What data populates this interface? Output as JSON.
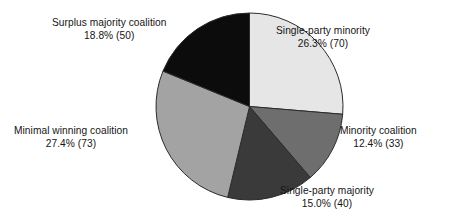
{
  "chart_data": {
    "type": "pie",
    "title": "",
    "subtitle": "",
    "xlabel": "",
    "ylabel": "",
    "legend_position": "none",
    "grid": false,
    "start_angle_deg": 0,
    "direction": "clockwise",
    "total_count": 266,
    "categories": [
      "Single-party minority",
      "Minority coalition",
      "Single-party majority",
      "Minimal winning coalition",
      "Surplus majority coalition"
    ],
    "values": [
      26.3,
      12.4,
      15.0,
      27.4,
      18.8
    ],
    "counts": [
      70,
      33,
      40,
      73,
      50
    ],
    "colors": [
      "#e6e6e6",
      "#6e6e6e",
      "#3a3a3a",
      "#a3a3a3",
      "#0c0c0c"
    ],
    "slices": [
      {
        "name": "Single-party minority",
        "percent": 26.3,
        "count": 70,
        "color": "#e6e6e6",
        "label_title": "Single-party minority",
        "label_value": "26.3% (70)"
      },
      {
        "name": "Minority coalition",
        "percent": 12.4,
        "count": 33,
        "color": "#6e6e6e",
        "label_title": "Minority coalition",
        "label_value": "12.4% (33)"
      },
      {
        "name": "Single-party majority",
        "percent": 15.0,
        "count": 40,
        "color": "#3a3a3a",
        "label_title": "Single-party majority",
        "label_value": "15.0% (40)"
      },
      {
        "name": "Minimal winning coalition",
        "percent": 27.4,
        "count": 73,
        "color": "#a3a3a3",
        "label_title": "Minimal winning coalition",
        "label_value": "27.4% (73)"
      },
      {
        "name": "Surplus majority coalition",
        "percent": 18.8,
        "count": 50,
        "color": "#0c0c0c",
        "label_title": "Surplus majority coalition",
        "label_value": "18.8% (50)"
      }
    ]
  },
  "style": {
    "background": "#ffffff",
    "text_color": "#151515",
    "slice_outline": "#2b2b2b"
  }
}
